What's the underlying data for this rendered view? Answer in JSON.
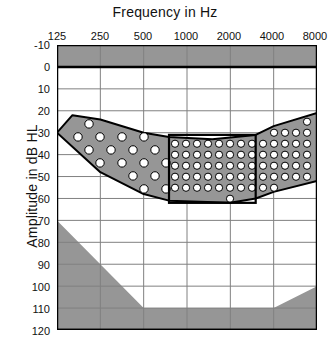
{
  "chart_data": {
    "type": "area",
    "xlabel": "Frequency in Hz",
    "ylabel": "Amplitude in dB HL",
    "x_tick_labels": [
      "125",
      "250",
      "500",
      "1000",
      "2000",
      "4000",
      "8000"
    ],
    "x_tick_values": [
      125,
      250,
      500,
      1000,
      2000,
      4000,
      8000
    ],
    "x_scale": "log",
    "y_tick_labels": [
      "-10",
      "0",
      "10",
      "20",
      "30",
      "40",
      "50",
      "60",
      "70",
      "80",
      "90",
      "100",
      "110",
      "120"
    ],
    "y_tick_values": [
      -10,
      0,
      10,
      20,
      30,
      40,
      50,
      60,
      70,
      80,
      90,
      100,
      110,
      120
    ],
    "ylim": [
      -10,
      120
    ],
    "y_inverted": true,
    "grid": true,
    "legend": "none",
    "colors": {
      "shaded_region": "#969696",
      "plot_background": "#ffffff",
      "gridline": "#808080",
      "axis": "#000000",
      "dot_fill": "#ffffff",
      "dot_stroke": "#000000"
    },
    "series": [
      {
        "name": "Top masked band (above 0 dB HL)",
        "type": "band",
        "y_from": -10,
        "y_to": 0,
        "x_from": 125,
        "x_to": 8000,
        "fill": "#969696"
      },
      {
        "name": "Speech banana (speech sounds region)",
        "type": "band",
        "fill": "#969696",
        "upper_boundary": [
          {
            "freq": 125,
            "db": 30
          },
          {
            "freq": 160,
            "db": 22
          },
          {
            "freq": 250,
            "db": 24
          },
          {
            "freq": 500,
            "db": 30
          },
          {
            "freq": 750,
            "db": 32
          },
          {
            "freq": 1500,
            "db": 33
          },
          {
            "freq": 3000,
            "db": 31
          },
          {
            "freq": 4000,
            "db": 27
          },
          {
            "freq": 8000,
            "db": 21
          }
        ],
        "lower_boundary": [
          {
            "freq": 125,
            "db": 30
          },
          {
            "freq": 250,
            "db": 48
          },
          {
            "freq": 500,
            "db": 58
          },
          {
            "freq": 750,
            "db": 61
          },
          {
            "freq": 2000,
            "db": 62
          },
          {
            "freq": 3000,
            "db": 60
          },
          {
            "freq": 4000,
            "db": 57
          },
          {
            "freq": 8000,
            "db": 52
          }
        ]
      },
      {
        "name": "Inner emphasis box (primary speech zone)",
        "type": "rect",
        "x_from_freq": 750,
        "x_to_freq": 3000,
        "y_from_db": 31,
        "y_to_db": 62,
        "stroke": "#000000",
        "fill": "none"
      },
      {
        "name": "Lower-left masked region",
        "type": "polygon",
        "vertices": [
          {
            "freq": 125,
            "db": 70
          },
          {
            "freq": 500,
            "db": 110
          },
          {
            "freq": 4000,
            "db": 110
          },
          {
            "freq": 8000,
            "db": 100
          },
          {
            "freq": 8000,
            "db": 120
          },
          {
            "freq": 125,
            "db": 120
          }
        ],
        "fill": "#969696"
      }
    ],
    "dot_markers": {
      "description": "White circular markers representing individual speech sound energy points inside the speech banana",
      "marker_fill": "#ffffff",
      "marker_stroke": "#000000",
      "sparse_left_count": 24,
      "dense_center_count": 108,
      "right_tail_count": 14
    }
  }
}
